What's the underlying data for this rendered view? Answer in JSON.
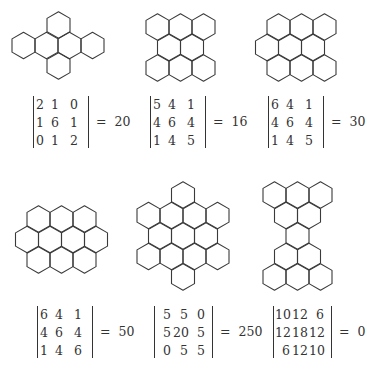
{
  "figure": {
    "hex_width": 23,
    "stroke_color": "#3a3a3a",
    "text_color": "#333333",
    "panels": [
      {
        "id": "molecule-1",
        "hexagons": [
          {
            "cx": 58.5,
            "cy": 25
          },
          {
            "cx": 23.5,
            "cy": 45.5
          },
          {
            "cx": 46.5,
            "cy": 45.5
          },
          {
            "cx": 69.5,
            "cy": 45.5
          },
          {
            "cx": 92.5,
            "cy": 45.5
          },
          {
            "cx": 58.5,
            "cy": 66
          }
        ],
        "determinant": {
          "x": 33,
          "y": 96,
          "rows": [
            [
              "2",
              "1",
              "0"
            ],
            [
              "1",
              "6",
              "1"
            ],
            [
              "0",
              "1",
              "2"
            ]
          ],
          "equals": "=",
          "value": "20"
        }
      },
      {
        "id": "molecule-2",
        "hexagons": [
          {
            "cx": 157.5,
            "cy": 27
          },
          {
            "cx": 180.5,
            "cy": 27
          },
          {
            "cx": 203.5,
            "cy": 27
          },
          {
            "cx": 169,
            "cy": 47.5
          },
          {
            "cx": 192,
            "cy": 47.5
          },
          {
            "cx": 157.5,
            "cy": 68
          },
          {
            "cx": 180.5,
            "cy": 68
          },
          {
            "cx": 203.5,
            "cy": 68
          }
        ],
        "determinant": {
          "x": 150,
          "y": 96,
          "rows": [
            [
              "5",
              "4",
              "1"
            ],
            [
              "4",
              "6",
              "4"
            ],
            [
              "1",
              "4",
              "5"
            ]
          ],
          "equals": "=",
          "value": "16"
        }
      },
      {
        "id": "molecule-3",
        "hexagons": [
          {
            "cx": 278.5,
            "cy": 27
          },
          {
            "cx": 301.5,
            "cy": 27
          },
          {
            "cx": 324.5,
            "cy": 27
          },
          {
            "cx": 267,
            "cy": 47.5
          },
          {
            "cx": 290,
            "cy": 47.5
          },
          {
            "cx": 313,
            "cy": 47.5
          },
          {
            "cx": 278.5,
            "cy": 68
          },
          {
            "cx": 301.5,
            "cy": 68
          },
          {
            "cx": 324.5,
            "cy": 68
          }
        ],
        "determinant": {
          "x": 268,
          "y": 96,
          "rows": [
            [
              "6",
              "4",
              "1"
            ],
            [
              "4",
              "6",
              "4"
            ],
            [
              "1",
              "4",
              "5"
            ]
          ],
          "equals": "=",
          "value": "30"
        }
      },
      {
        "id": "molecule-4",
        "hexagons": [
          {
            "cx": 38.5,
            "cy": 219
          },
          {
            "cx": 61.5,
            "cy": 219
          },
          {
            "cx": 84.5,
            "cy": 219
          },
          {
            "cx": 27,
            "cy": 239.5
          },
          {
            "cx": 50,
            "cy": 239.5
          },
          {
            "cx": 73,
            "cy": 239.5
          },
          {
            "cx": 96,
            "cy": 239.5
          },
          {
            "cx": 38.5,
            "cy": 260
          },
          {
            "cx": 61.5,
            "cy": 260
          },
          {
            "cx": 84.5,
            "cy": 260
          }
        ],
        "determinant": {
          "x": 37,
          "y": 306,
          "rows": [
            [
              "6",
              "4",
              "1"
            ],
            [
              "4",
              "6",
              "4"
            ],
            [
              "1",
              "4",
              "6"
            ]
          ],
          "equals": "=",
          "value": "50"
        }
      },
      {
        "id": "molecule-5",
        "hexagons": [
          {
            "cx": 183,
            "cy": 195
          },
          {
            "cx": 148.5,
            "cy": 215.5
          },
          {
            "cx": 171.5,
            "cy": 215.5
          },
          {
            "cx": 194.5,
            "cy": 215.5
          },
          {
            "cx": 217.5,
            "cy": 215.5
          },
          {
            "cx": 160,
            "cy": 236
          },
          {
            "cx": 183,
            "cy": 236
          },
          {
            "cx": 206,
            "cy": 236
          },
          {
            "cx": 148.5,
            "cy": 256.5
          },
          {
            "cx": 171.5,
            "cy": 256.5
          },
          {
            "cx": 194.5,
            "cy": 256.5
          },
          {
            "cx": 217.5,
            "cy": 256.5
          },
          {
            "cx": 183,
            "cy": 277
          }
        ],
        "determinant": {
          "x": 154,
          "y": 306,
          "rows": [
            [
              "5",
              "5",
              "0"
            ],
            [
              "5",
              "20",
              "5"
            ],
            [
              "0",
              "5",
              "5"
            ]
          ],
          "equals": "=",
          "value": "250"
        }
      },
      {
        "id": "molecule-6",
        "hexagons": [
          {
            "cx": 274.5,
            "cy": 195
          },
          {
            "cx": 297.5,
            "cy": 195
          },
          {
            "cx": 320.5,
            "cy": 195
          },
          {
            "cx": 286,
            "cy": 215.5
          },
          {
            "cx": 309,
            "cy": 215.5
          },
          {
            "cx": 297.5,
            "cy": 236
          },
          {
            "cx": 286,
            "cy": 256.5
          },
          {
            "cx": 309,
            "cy": 256.5
          },
          {
            "cx": 274.5,
            "cy": 277
          },
          {
            "cx": 297.5,
            "cy": 277
          },
          {
            "cx": 320.5,
            "cy": 277
          }
        ],
        "determinant": {
          "x": 273,
          "y": 306,
          "rows": [
            [
              "10",
              "12",
              "6"
            ],
            [
              "12",
              "18",
              "12"
            ],
            [
              "6",
              "12",
              "10"
            ]
          ],
          "equals": "=",
          "value": "0"
        }
      }
    ]
  }
}
